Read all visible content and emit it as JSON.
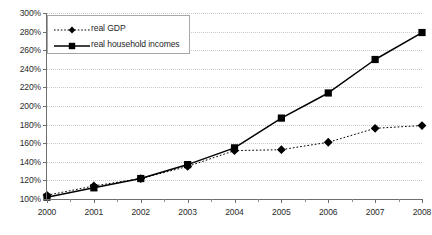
{
  "chart_data": {
    "type": "line",
    "title": "",
    "xlabel": "",
    "ylabel": "",
    "x": [
      2000,
      2001,
      2002,
      2003,
      2004,
      2005,
      2006,
      2007,
      2008
    ],
    "xticklabels": [
      "2000",
      "2001",
      "2002",
      "2003",
      "2004",
      "2005",
      "2006",
      "2007",
      "2008"
    ],
    "yticklabels": [
      "100%",
      "120%",
      "140%",
      "160%",
      "180%",
      "200%",
      "220%",
      "240%",
      "260%",
      "280%",
      "300%"
    ],
    "ytickvalues": [
      100,
      120,
      140,
      160,
      180,
      200,
      220,
      240,
      260,
      280,
      300
    ],
    "ylim": [
      100,
      300
    ],
    "xlim": [
      2000,
      2008
    ],
    "grid": true,
    "legend_position": "upper-left",
    "series": [
      {
        "name": "real GDP",
        "marker": "diamond",
        "linestyle": "dotted",
        "color": "#000000",
        "values": [
          104,
          114,
          122,
          135,
          152,
          153,
          161,
          176,
          179
        ]
      },
      {
        "name": "real household incomes",
        "marker": "square",
        "linestyle": "solid",
        "color": "#000000",
        "values": [
          102,
          112,
          122,
          137,
          155,
          187,
          214,
          250,
          279
        ]
      }
    ]
  },
  "legend": {
    "items": [
      {
        "label": "real GDP"
      },
      {
        "label": "real household incomes"
      }
    ]
  },
  "colors": {
    "series": "#000000",
    "gridline": "#c9c9c9",
    "axis": "#6e6e6e",
    "background": "#ffffff",
    "text": "#2b2b2b"
  }
}
